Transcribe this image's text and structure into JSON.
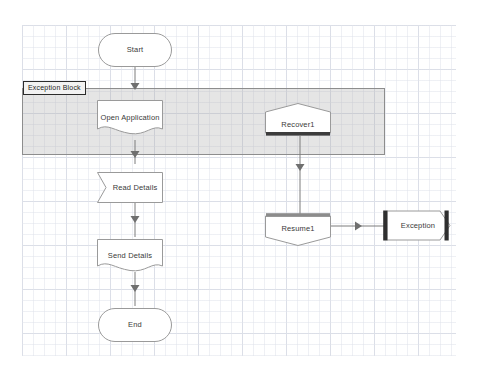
{
  "diagram": {
    "canvas": {
      "width": 482,
      "height": 373,
      "background": "#ffffff"
    },
    "grid": {
      "minor_spacing": 11,
      "major_spacing": 44,
      "minor_color": "#e1e4ec",
      "major_color": "#cdd2de"
    },
    "scope": {
      "label": "Exception Block",
      "fill": "#aaaaaa",
      "border": "#8d8d8d"
    },
    "nodes": [
      {
        "id": "start",
        "label": "Start",
        "shape": "terminator"
      },
      {
        "id": "open-app",
        "label": "Open Application",
        "shape": "document"
      },
      {
        "id": "read",
        "label": "Read Details",
        "shape": "flag"
      },
      {
        "id": "send",
        "label": "Send Details",
        "shape": "document"
      },
      {
        "id": "end",
        "label": "End",
        "shape": "terminator"
      },
      {
        "id": "recover1",
        "label": "Recover1",
        "shape": "pentagon-up"
      },
      {
        "id": "resume1",
        "label": "Resume1",
        "shape": "pentagon-down"
      },
      {
        "id": "exception",
        "label": "Exception",
        "shape": "barred-hexagon"
      }
    ],
    "edges": [
      {
        "from": "start",
        "to": "open-app",
        "direction": "down"
      },
      {
        "from": "open-app",
        "to": "read",
        "direction": "down"
      },
      {
        "from": "read",
        "to": "send",
        "direction": "down"
      },
      {
        "from": "send",
        "to": "end",
        "direction": "down"
      },
      {
        "from": "recover1",
        "to": "resume1",
        "direction": "down"
      },
      {
        "from": "resume1",
        "to": "exception",
        "direction": "right"
      }
    ],
    "colors": {
      "node_stroke": "#9a9a9a",
      "node_fill": "#ffffff",
      "text": "#3a3a3a",
      "connector": "#7d7d7d",
      "accent_bar": "#3c3c3c"
    }
  }
}
